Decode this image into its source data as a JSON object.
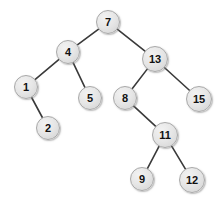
{
  "diagram": {
    "type": "binary-search-tree",
    "background_color": "#ffffff",
    "node_fill_color": "#e3e3e3",
    "node_border_color": "#a8a8a8",
    "node_text_color": "#111111",
    "edge_color": "#3a3a3a",
    "edge_width": 1.6,
    "width": 222,
    "height": 203
  },
  "chart_data": {
    "type": "diagram",
    "root": "7",
    "nodes": [
      {
        "id": "n7",
        "label": "7",
        "x": 108,
        "y": 22,
        "r": 12,
        "font_size": 11,
        "depth": 0,
        "parent": null
      },
      {
        "id": "n4",
        "label": "4",
        "x": 68,
        "y": 52,
        "r": 12,
        "font_size": 11,
        "depth": 1,
        "parent": "n7",
        "side": "left"
      },
      {
        "id": "n13",
        "label": "13",
        "x": 155,
        "y": 59,
        "r": 13,
        "font_size": 11,
        "depth": 1,
        "parent": "n7",
        "side": "right"
      },
      {
        "id": "n1",
        "label": "1",
        "x": 26,
        "y": 87,
        "r": 12,
        "font_size": 11,
        "depth": 2,
        "parent": "n4",
        "side": "left"
      },
      {
        "id": "n5",
        "label": "5",
        "x": 90,
        "y": 98,
        "r": 12,
        "font_size": 11,
        "depth": 2,
        "parent": "n4",
        "side": "right"
      },
      {
        "id": "n8",
        "label": "8",
        "x": 125,
        "y": 98,
        "r": 12,
        "font_size": 11,
        "depth": 2,
        "parent": "n13",
        "side": "left"
      },
      {
        "id": "n15",
        "label": "15",
        "x": 199,
        "y": 99,
        "r": 13,
        "font_size": 11,
        "depth": 2,
        "parent": "n13",
        "side": "right"
      },
      {
        "id": "n2",
        "label": "2",
        "x": 48,
        "y": 128,
        "r": 12,
        "font_size": 11,
        "depth": 3,
        "parent": "n1",
        "side": "right"
      },
      {
        "id": "n11",
        "label": "11",
        "x": 165,
        "y": 135,
        "r": 13,
        "font_size": 11,
        "depth": 3,
        "parent": "n8",
        "side": "right"
      },
      {
        "id": "n9",
        "label": "9",
        "x": 142,
        "y": 179,
        "r": 12,
        "font_size": 11,
        "depth": 4,
        "parent": "n11",
        "side": "left"
      },
      {
        "id": "n12",
        "label": "12",
        "x": 192,
        "y": 180,
        "r": 13,
        "font_size": 11,
        "depth": 4,
        "parent": "n11",
        "side": "right"
      }
    ],
    "edges": [
      {
        "from": "n7",
        "to": "n4"
      },
      {
        "from": "n7",
        "to": "n13"
      },
      {
        "from": "n4",
        "to": "n1"
      },
      {
        "from": "n4",
        "to": "n5"
      },
      {
        "from": "n1",
        "to": "n2"
      },
      {
        "from": "n13",
        "to": "n8"
      },
      {
        "from": "n13",
        "to": "n15"
      },
      {
        "from": "n8",
        "to": "n11"
      },
      {
        "from": "n11",
        "to": "n9"
      },
      {
        "from": "n11",
        "to": "n12"
      }
    ]
  }
}
